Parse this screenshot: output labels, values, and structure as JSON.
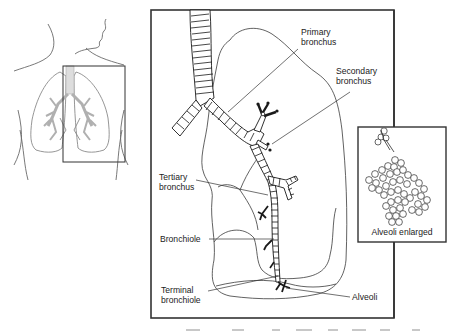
{
  "figure": {
    "overview": {
      "description": "Torso outline with lungs and highlighted region box"
    },
    "labels": {
      "primary_bronchus": [
        "Primary",
        "bronchus"
      ],
      "secondary_bronchus": [
        "Secondary",
        "bronchus"
      ],
      "tertiary_bronchus": [
        "Tertiary",
        "bronchus"
      ],
      "bronchiole": [
        "Bronchiole"
      ],
      "terminal_bronchiole": [
        "Terminal",
        "bronchiole"
      ],
      "alveoli": [
        "Alveoli"
      ]
    },
    "inset": {
      "caption": "Alveoli enlarged"
    },
    "colors": {
      "line": "#1a1a1a",
      "faint_line": "#8a8a8a",
      "frame": "#333333",
      "background": "#ffffff"
    }
  }
}
